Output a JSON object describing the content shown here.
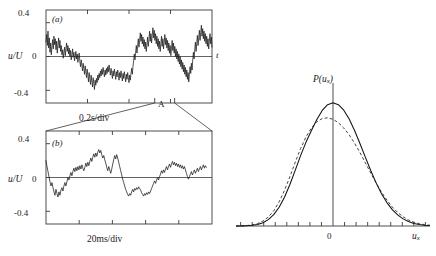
{
  "figure": {
    "panels": [
      {
        "id": "a",
        "tag": "(a)",
        "ylabel": "u/U",
        "yticks": [
          "0.4",
          "0",
          "-0.4"
        ],
        "ytick_values": [
          0.4,
          0,
          -0.4
        ],
        "xlabel": "0.2s/div",
        "taxis_label": "t",
        "region_label": "A"
      },
      {
        "id": "b",
        "tag": "(b)",
        "ylabel": "u/U",
        "yticks": [
          "0.4",
          "0",
          "-0.4"
        ],
        "ytick_values": [
          0.4,
          0,
          -0.4
        ],
        "xlabel": "20ms/div"
      }
    ],
    "pdf_panel": {
      "ylabel": "P(u",
      "ylabel_sub": "x",
      "ylabel_close": ")",
      "xlabel": "u",
      "xlabel_sub": "x",
      "xtick_label_zero": "0"
    },
    "colors": {
      "ink": "#1a1a1a",
      "axis": "#3a3a3a",
      "curve_solid": "#111111",
      "curve_dashed": "#222222",
      "background": "#ffffff"
    }
  },
  "chart_data": [
    {
      "type": "line",
      "title": "(a) turbulent velocity signal, coarse time base",
      "xlabel": "0.2s/div",
      "ylabel": "u/U",
      "ylim": [
        -0.55,
        0.55
      ],
      "yticks": [
        0.4,
        0,
        -0.4
      ],
      "xlim": [
        0,
        1
      ],
      "grid": false,
      "legend": "none",
      "annotations": [
        {
          "text": "A",
          "x": 0.7,
          "note": "expanded region bracket on lower axis"
        },
        {
          "text": "t",
          "x": 1.03,
          "y": 0.0,
          "note": "time axis label at right"
        }
      ],
      "x": [
        0,
        0.004,
        0.008,
        0.012,
        0.016,
        0.02,
        0.024,
        0.028,
        0.032,
        0.036,
        0.04,
        0.044,
        0.048,
        0.052,
        0.056,
        0.06,
        0.064,
        0.068,
        0.072,
        0.076,
        0.08,
        0.084,
        0.088,
        0.092,
        0.096,
        0.1,
        0.104,
        0.108,
        0.112,
        0.116,
        0.12,
        0.124,
        0.128,
        0.132,
        0.136,
        0.14,
        0.144,
        0.148,
        0.152,
        0.156,
        0.16,
        0.164,
        0.168,
        0.172,
        0.176,
        0.18,
        0.184,
        0.188,
        0.192,
        0.196,
        0.2,
        0.204,
        0.208,
        0.212,
        0.216,
        0.22,
        0.224,
        0.228,
        0.232,
        0.236,
        0.24,
        0.244,
        0.248,
        0.252,
        0.256,
        0.26,
        0.264,
        0.268,
        0.272,
        0.276,
        0.28,
        0.284,
        0.288,
        0.292,
        0.296,
        0.3,
        0.304,
        0.308,
        0.312,
        0.316,
        0.32,
        0.324,
        0.328,
        0.332,
        0.336,
        0.34,
        0.344,
        0.348,
        0.352,
        0.356,
        0.36,
        0.364,
        0.368,
        0.372,
        0.376,
        0.38,
        0.384,
        0.388,
        0.392,
        0.396,
        0.4,
        0.404,
        0.408,
        0.412,
        0.416,
        0.42,
        0.424,
        0.428,
        0.432,
        0.436,
        0.44,
        0.444,
        0.448,
        0.452,
        0.456,
        0.46,
        0.464,
        0.468,
        0.472,
        0.476,
        0.48,
        0.484,
        0.488,
        0.492,
        0.496,
        0.5,
        0.504,
        0.508,
        0.512,
        0.516,
        0.52,
        0.524,
        0.528,
        0.532,
        0.536,
        0.54,
        0.544,
        0.548,
        0.552,
        0.556,
        0.56,
        0.564,
        0.568,
        0.572,
        0.576,
        0.58,
        0.584,
        0.588,
        0.592,
        0.596,
        0.6,
        0.604,
        0.608,
        0.612,
        0.616,
        0.62,
        0.624,
        0.628,
        0.632,
        0.636,
        0.64,
        0.644,
        0.648,
        0.652,
        0.656,
        0.66,
        0.664,
        0.668,
        0.672,
        0.676,
        0.68,
        0.684,
        0.688,
        0.692,
        0.696,
        0.7,
        0.704,
        0.708,
        0.712,
        0.716,
        0.72,
        0.724,
        0.728,
        0.732,
        0.736,
        0.74,
        0.744,
        0.748,
        0.752,
        0.756,
        0.76,
        0.764,
        0.768,
        0.772,
        0.776,
        0.78,
        0.784,
        0.788,
        0.792,
        0.796,
        0.8,
        0.804,
        0.808,
        0.812,
        0.816,
        0.82,
        0.824,
        0.828,
        0.832,
        0.836,
        0.84,
        0.844,
        0.848,
        0.852,
        0.856,
        0.86,
        0.864,
        0.868,
        0.872,
        0.876,
        0.88,
        0.884,
        0.888,
        0.892,
        0.896,
        0.9,
        0.904,
        0.908,
        0.912,
        0.916,
        0.92,
        0.924,
        0.928,
        0.932,
        0.936,
        0.94,
        0.944,
        0.948,
        0.952,
        0.956,
        0.96,
        0.964,
        0.968,
        0.972,
        0.976,
        0.98,
        0.984,
        0.988,
        0.992,
        0.996,
        1
      ],
      "values": [
        0.17,
        0.26,
        0.13,
        0.3,
        0.1,
        0.22,
        0.05,
        0.16,
        0.02,
        0.12,
        0.2,
        0.09,
        0.24,
        0.14,
        0.21,
        0.08,
        0.18,
        0.04,
        0.14,
        0.22,
        0.1,
        0.19,
        0.06,
        0.13,
        0.02,
        0.08,
        -0.02,
        0.05,
        0.11,
        0.01,
        0.09,
        0.16,
        0.06,
        0.13,
        0.03,
        0.1,
        0.0,
        0.07,
        -0.04,
        0.02,
        0.09,
        -0.01,
        0.05,
        -0.05,
        0.0,
        0.06,
        -0.03,
        0.03,
        -0.07,
        -0.01,
        0.04,
        -0.06,
        -0.12,
        -0.04,
        -0.1,
        -0.17,
        -0.08,
        -0.14,
        -0.21,
        -0.11,
        -0.18,
        -0.25,
        -0.15,
        -0.22,
        -0.3,
        -0.19,
        -0.26,
        -0.33,
        -0.22,
        -0.29,
        -0.36,
        -0.25,
        -0.32,
        -0.39,
        -0.28,
        -0.34,
        -0.26,
        -0.31,
        -0.22,
        -0.28,
        -0.2,
        -0.25,
        -0.17,
        -0.23,
        -0.15,
        -0.21,
        -0.13,
        -0.19,
        -0.24,
        -0.16,
        -0.22,
        -0.14,
        -0.2,
        -0.12,
        -0.18,
        -0.1,
        -0.16,
        -0.22,
        -0.14,
        -0.2,
        -0.26,
        -0.17,
        -0.23,
        -0.15,
        -0.21,
        -0.27,
        -0.18,
        -0.24,
        -0.16,
        -0.22,
        -0.28,
        -0.19,
        -0.25,
        -0.17,
        -0.23,
        -0.29,
        -0.2,
        -0.26,
        -0.18,
        -0.24,
        -0.3,
        -0.21,
        -0.27,
        -0.19,
        -0.25,
        -0.31,
        -0.22,
        -0.28,
        -0.2,
        -0.14,
        -0.21,
        -0.12,
        -0.05,
        0.03,
        -0.04,
        0.05,
        0.13,
        0.04,
        0.12,
        0.21,
        0.11,
        0.19,
        0.28,
        0.18,
        0.26,
        0.15,
        0.23,
        0.12,
        0.2,
        0.09,
        0.17,
        0.06,
        0.14,
        0.23,
        0.12,
        0.2,
        0.3,
        0.18,
        0.27,
        0.16,
        0.25,
        0.34,
        0.22,
        0.31,
        0.19,
        0.27,
        0.15,
        0.24,
        0.12,
        0.21,
        0.09,
        0.18,
        0.06,
        0.15,
        0.24,
        0.12,
        0.21,
        0.09,
        0.17,
        0.26,
        0.14,
        0.22,
        0.1,
        0.19,
        0.07,
        0.16,
        0.04,
        0.13,
        0.01,
        0.1,
        0.19,
        0.07,
        0.16,
        0.04,
        0.12,
        0.0,
        0.09,
        -0.03,
        0.06,
        -0.06,
        0.03,
        -0.09,
        0.0,
        -0.12,
        -0.04,
        -0.15,
        -0.07,
        -0.18,
        -0.1,
        -0.21,
        -0.13,
        -0.24,
        -0.16,
        -0.27,
        -0.19,
        -0.3,
        -0.21,
        -0.12,
        -0.2,
        -0.08,
        -0.16,
        -0.04,
        0.05,
        -0.03,
        0.08,
        0.17,
        0.06,
        0.15,
        0.25,
        0.13,
        0.22,
        0.31,
        0.19,
        0.28,
        0.37,
        0.24,
        0.33,
        0.21,
        0.3,
        0.18,
        0.27,
        0.15,
        0.24,
        0.12,
        0.21,
        0.09,
        0.18,
        0.27,
        0.15,
        0.23,
        0.11,
        0.19,
        0.07,
        0.15,
        0.03,
        0.11,
        -0.01,
        0.07,
        0.14,
        0.02,
        0.09
      ]
    },
    {
      "type": "line",
      "title": "(b) turbulent velocity signal, expanded time base (region A)",
      "xlabel": "20ms/div",
      "ylabel": "u/U",
      "ylim": [
        -0.55,
        0.55
      ],
      "yticks": [
        0.4,
        0,
        -0.4
      ],
      "xlim": [
        0,
        1
      ],
      "grid": false,
      "legend": "none",
      "x": [
        0,
        0.006,
        0.012,
        0.018,
        0.024,
        0.03,
        0.036,
        0.042,
        0.048,
        0.054,
        0.06,
        0.066,
        0.072,
        0.078,
        0.084,
        0.09,
        0.096,
        0.102,
        0.108,
        0.114,
        0.12,
        0.126,
        0.132,
        0.138,
        0.144,
        0.15,
        0.156,
        0.162,
        0.168,
        0.174,
        0.18,
        0.186,
        0.192,
        0.198,
        0.204,
        0.21,
        0.216,
        0.222,
        0.228,
        0.234,
        0.24,
        0.246,
        0.252,
        0.258,
        0.264,
        0.27,
        0.276,
        0.282,
        0.288,
        0.294,
        0.3,
        0.306,
        0.312,
        0.318,
        0.324,
        0.33,
        0.336,
        0.342,
        0.348,
        0.354,
        0.36,
        0.366,
        0.372,
        0.378,
        0.384,
        0.39,
        0.396,
        0.402,
        0.408,
        0.414,
        0.42,
        0.426,
        0.432,
        0.438,
        0.444,
        0.45,
        0.456,
        0.462,
        0.468,
        0.474,
        0.48,
        0.486,
        0.492,
        0.498,
        0.504,
        0.51,
        0.516,
        0.522,
        0.528,
        0.534,
        0.54,
        0.546,
        0.552,
        0.558,
        0.564,
        0.57,
        0.576,
        0.582,
        0.588,
        0.594,
        0.6,
        0.606,
        0.612,
        0.618,
        0.624,
        0.63,
        0.636,
        0.642,
        0.648,
        0.654,
        0.66,
        0.666,
        0.672,
        0.678,
        0.684,
        0.69,
        0.696,
        0.702,
        0.708,
        0.714,
        0.72,
        0.726,
        0.732,
        0.738,
        0.744,
        0.75,
        0.756,
        0.762,
        0.768,
        0.774,
        0.78,
        0.786,
        0.792,
        0.798,
        0.804,
        0.81,
        0.816,
        0.822,
        0.828,
        0.834,
        0.84,
        0.846,
        0.852,
        0.858,
        0.864,
        0.87,
        0.876,
        0.882,
        0.888,
        0.894,
        0.9,
        0.906,
        0.912,
        0.918,
        0.924,
        0.93,
        0.936,
        0.942,
        0.948,
        0.954,
        0.96,
        0.966,
        0.972,
        0.978,
        0.984,
        0.99,
        0.996,
        1
      ],
      "values": [
        0.2,
        0.13,
        0.07,
        0.01,
        -0.05,
        -0.1,
        -0.06,
        -0.12,
        -0.17,
        -0.21,
        -0.14,
        -0.19,
        -0.23,
        -0.17,
        -0.21,
        -0.15,
        -0.12,
        -0.16,
        -0.1,
        -0.06,
        -0.1,
        -0.05,
        0.0,
        -0.03,
        0.02,
        0.06,
        0.02,
        0.07,
        0.11,
        0.07,
        0.12,
        0.08,
        0.13,
        0.09,
        0.14,
        0.1,
        0.15,
        0.11,
        0.08,
        0.12,
        0.17,
        0.13,
        0.18,
        0.14,
        0.19,
        0.23,
        0.19,
        0.24,
        0.28,
        0.24,
        0.29,
        0.25,
        0.3,
        0.33,
        0.29,
        0.32,
        0.27,
        0.23,
        0.26,
        0.21,
        0.17,
        0.12,
        0.08,
        0.13,
        0.09,
        0.05,
        0.1,
        0.16,
        0.21,
        0.26,
        0.22,
        0.27,
        0.23,
        0.18,
        0.13,
        0.08,
        0.03,
        -0.02,
        -0.06,
        -0.1,
        -0.14,
        -0.17,
        -0.2,
        -0.22,
        -0.19,
        -0.21,
        -0.17,
        -0.14,
        -0.17,
        -0.13,
        -0.15,
        -0.12,
        -0.14,
        -0.11,
        -0.13,
        -0.15,
        -0.18,
        -0.2,
        -0.22,
        -0.19,
        -0.21,
        -0.18,
        -0.2,
        -0.17,
        -0.19,
        -0.16,
        -0.13,
        -0.1,
        -0.07,
        -0.04,
        -0.07,
        -0.03,
        0.0,
        -0.03,
        0.01,
        0.04,
        0.08,
        0.05,
        0.09,
        0.06,
        0.1,
        0.13,
        0.09,
        0.13,
        0.16,
        0.12,
        0.16,
        0.19,
        0.15,
        0.18,
        0.14,
        0.17,
        0.13,
        0.16,
        0.12,
        0.15,
        0.11,
        0.14,
        0.1,
        0.13,
        0.09,
        0.05,
        0.01,
        -0.02,
        0.01,
        0.04,
        0.07,
        0.03,
        0.06,
        0.09,
        0.05,
        0.08,
        0.11,
        0.07,
        0.1,
        0.13,
        0.09,
        0.12,
        0.15,
        0.11,
        0.14,
        0.12
      ]
    },
    {
      "type": "line",
      "title": "Probability density function of streamwise velocity",
      "xlabel": "u_x",
      "ylabel": "P(u_x)",
      "xlim": [
        -4.2,
        4.2
      ],
      "ylim": [
        0,
        1.12
      ],
      "xticks": [
        -4,
        -3.5,
        -3,
        -2.5,
        -2,
        -1.5,
        -1,
        -0.5,
        0,
        0.5,
        1,
        1.5,
        2,
        2.5,
        3,
        3.5,
        4
      ],
      "xtick_labels": [
        "",
        "",
        "",
        "",
        "",
        "",
        "",
        "",
        "0",
        "",
        "",
        "",
        "",
        "",
        "",
        "",
        ""
      ],
      "grid": false,
      "legend": "none",
      "series": [
        {
          "name": "measured pdf (solid)",
          "style": "solid",
          "peak_x": 0.12,
          "peak_y": 1.0,
          "sigma": 1.0,
          "values": [
            0.0003,
            0.0009,
            0.0024,
            0.0058,
            0.013,
            0.027,
            0.052,
            0.092,
            0.152,
            0.234,
            0.337,
            0.454,
            0.573,
            0.681,
            0.775,
            0.865,
            0.938,
            0.985,
            1.0,
            0.985,
            0.94,
            0.868,
            0.775,
            0.67,
            0.559,
            0.45,
            0.35,
            0.262,
            0.19,
            0.133,
            0.09,
            0.058,
            0.036,
            0.021,
            0.012,
            0.0065,
            0.0033
          ]
        },
        {
          "name": "gaussian fit (dashed)",
          "style": "dashed",
          "peak_x": -0.08,
          "peak_y": 0.88,
          "sigma": 1.08,
          "values": [
            0.0006,
            0.0016,
            0.004,
            0.0092,
            0.02,
            0.04,
            0.073,
            0.124,
            0.196,
            0.289,
            0.4,
            0.518,
            0.63,
            0.724,
            0.796,
            0.846,
            0.872,
            0.878,
            0.866,
            0.838,
            0.795,
            0.74,
            0.672,
            0.596,
            0.513,
            0.43,
            0.35,
            0.275,
            0.21,
            0.154,
            0.11,
            0.075,
            0.049,
            0.031,
            0.019,
            0.011,
            0.006
          ]
        }
      ]
    }
  ]
}
